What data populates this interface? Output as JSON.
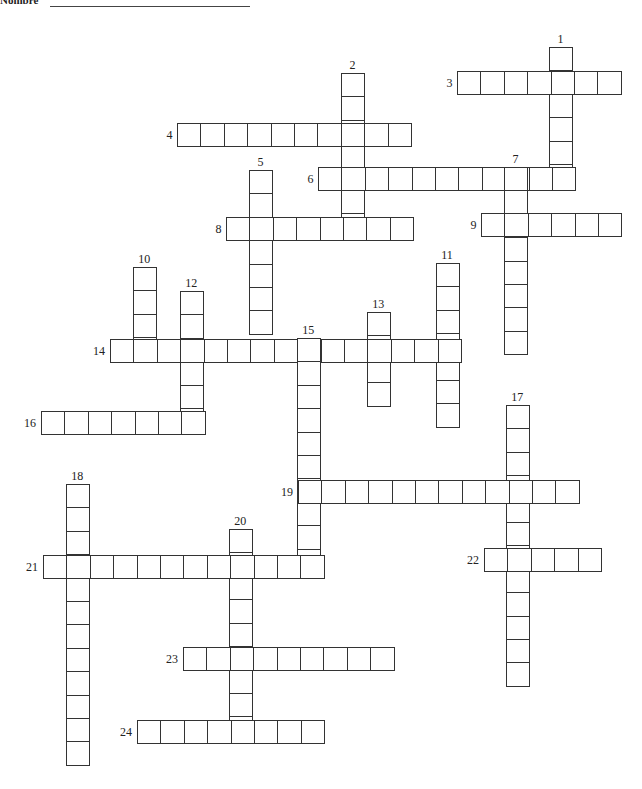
{
  "header": {
    "label": "Nombre"
  },
  "cell_size": 23.4,
  "words": [
    {
      "n": "1",
      "dir": "down",
      "x": 549,
      "y": 47,
      "len": 6
    },
    {
      "n": "2",
      "dir": "down",
      "x": 341,
      "y": 73,
      "len": 7
    },
    {
      "n": "3",
      "dir": "across",
      "x": 457,
      "y": 71,
      "len": 7
    },
    {
      "n": "4",
      "dir": "across",
      "x": 177,
      "y": 123,
      "len": 10
    },
    {
      "n": "5",
      "dir": "down",
      "x": 249,
      "y": 170,
      "len": 7
    },
    {
      "n": "6",
      "dir": "across",
      "x": 318,
      "y": 167,
      "len": 11
    },
    {
      "n": "7",
      "dir": "down",
      "x": 504,
      "y": 167,
      "len": 8
    },
    {
      "n": "8",
      "dir": "across",
      "x": 226,
      "y": 217,
      "len": 8
    },
    {
      "n": "9",
      "dir": "across",
      "x": 481,
      "y": 213,
      "len": 6
    },
    {
      "n": "10",
      "dir": "down",
      "x": 133,
      "y": 267,
      "len": 4
    },
    {
      "n": "11",
      "dir": "down",
      "x": 436,
      "y": 263,
      "len": 7
    },
    {
      "n": "12",
      "dir": "down",
      "x": 180,
      "y": 291,
      "len": 6
    },
    {
      "n": "13",
      "dir": "down",
      "x": 367,
      "y": 312,
      "len": 4
    },
    {
      "n": "14",
      "dir": "across",
      "x": 110,
      "y": 339,
      "len": 15
    },
    {
      "n": "15",
      "dir": "down",
      "x": 297,
      "y": 338,
      "len": 10
    },
    {
      "n": "16",
      "dir": "across",
      "x": 41,
      "y": 411,
      "len": 7
    },
    {
      "n": "17",
      "dir": "down",
      "x": 506,
      "y": 405,
      "len": 12
    },
    {
      "n": "18",
      "dir": "down",
      "x": 66,
      "y": 484,
      "len": 12
    },
    {
      "n": "19",
      "dir": "across",
      "x": 298,
      "y": 480,
      "len": 12
    },
    {
      "n": "20",
      "dir": "down",
      "x": 229,
      "y": 529,
      "len": 9
    },
    {
      "n": "21",
      "dir": "across",
      "x": 43,
      "y": 555,
      "len": 12
    },
    {
      "n": "22",
      "dir": "across",
      "x": 484,
      "y": 548,
      "len": 5
    },
    {
      "n": "23",
      "dir": "across",
      "x": 183,
      "y": 647,
      "len": 9
    },
    {
      "n": "24",
      "dir": "across",
      "x": 137,
      "y": 720,
      "len": 8
    }
  ]
}
